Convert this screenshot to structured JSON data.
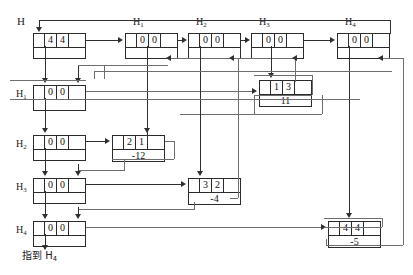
{
  "diagram": {
    "title_label": "H",
    "caption": "指到 H4",
    "caption_text": "指到 H",
    "caption_sub": "4",
    "colors": {
      "line": "#2f2f2f",
      "line_light": "#6e6e6e",
      "border": "#2b2b2b",
      "text": "#111111",
      "background": "#ffffff"
    }
  },
  "column_headers": [
    {
      "name": "h1",
      "text": "H",
      "sub": "1"
    },
    {
      "name": "h2",
      "text": "H",
      "sub": "2"
    },
    {
      "name": "h3",
      "text": "H",
      "sub": "3"
    },
    {
      "name": "h4",
      "text": "H",
      "sub": "4"
    }
  ],
  "row_headers": [
    {
      "name": "h1",
      "text": "H",
      "sub": "1"
    },
    {
      "name": "h2",
      "text": "H",
      "sub": "2"
    },
    {
      "name": "h3",
      "text": "H",
      "sub": "3"
    },
    {
      "name": "h4",
      "text": "H",
      "sub": "4"
    }
  ],
  "nodes": {
    "head_main": {
      "c0": "",
      "c1": "4",
      "c2": "4",
      "c3": ""
    },
    "head_col1": {
      "c0": "",
      "c1": "0",
      "c2": "0",
      "c3": ""
    },
    "head_col2": {
      "c0": "",
      "c1": "0",
      "c2": "0",
      "c3": ""
    },
    "head_col3": {
      "c0": "",
      "c1": "0",
      "c2": "0",
      "c3": ""
    },
    "head_col4": {
      "c0": "",
      "c1": "0",
      "c2": "0",
      "c3": ""
    },
    "head_row1": {
      "c0": "",
      "c1": "0",
      "c2": "0",
      "c3": ""
    },
    "head_row2": {
      "c0": "",
      "c1": "0",
      "c2": "0",
      "c3": ""
    },
    "head_row3": {
      "c0": "",
      "c1": "0",
      "c2": "0",
      "c3": ""
    },
    "head_row4": {
      "c0": "",
      "c1": "0",
      "c2": "0",
      "c3": ""
    },
    "rec_2_1": {
      "c0": "",
      "c1": "2",
      "c2": "1",
      "c3": "",
      "value": "-12"
    },
    "rec_1_3": {
      "c0": "",
      "c1": "1",
      "c2": "3",
      "c3": "",
      "value": "11"
    },
    "rec_3_2": {
      "c0": "",
      "c1": "3",
      "c2": "2",
      "c3": "",
      "value": "-4"
    },
    "rec_4_4": {
      "c0": "",
      "c1": "4",
      "c2": "4",
      "c3": "",
      "value": "-5"
    }
  }
}
